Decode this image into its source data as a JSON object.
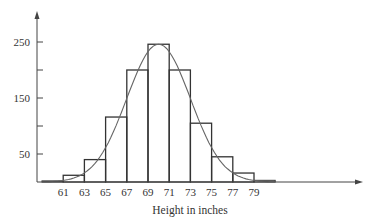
{
  "chart_data": {
    "type": "bar",
    "subtype": "histogram with normal curve overlay",
    "title": "",
    "xlabel": "Height in inches",
    "ylabel": "",
    "bin_edges": [
      59,
      61,
      63,
      65,
      67,
      69,
      71,
      73,
      75,
      77,
      79,
      81
    ],
    "categories": [
      "59-61",
      "61-63",
      "63-65",
      "65-67",
      "67-69",
      "69-71",
      "71-73",
      "73-75",
      "75-77",
      "77-79",
      "79-81"
    ],
    "values": [
      2,
      12,
      40,
      116,
      200,
      246,
      200,
      105,
      45,
      16,
      3
    ],
    "curve": {
      "type": "normal",
      "mean": 70,
      "peak": 246,
      "sd": 3.0
    },
    "x_tick_labels": [
      "61",
      "63",
      "65",
      "67",
      "69",
      "71",
      "73",
      "75",
      "77",
      "79"
    ],
    "y_tick_labels": [
      "250",
      "150",
      "50"
    ],
    "y_minor_ticks": [
      100,
      200
    ],
    "ylim": [
      0,
      290
    ],
    "xlim": [
      56,
      84
    ],
    "grid": false,
    "legend": null,
    "colors": {
      "bar_stroke": "#333333",
      "curve": "#666666",
      "axis": "#444444"
    }
  }
}
